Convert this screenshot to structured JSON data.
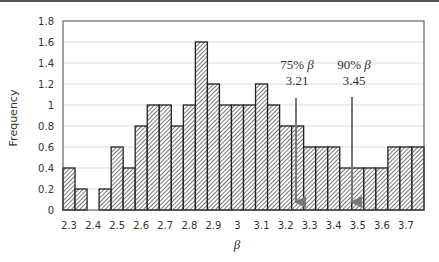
{
  "chart_data": {
    "type": "bar",
    "title": "",
    "xlabel": "β",
    "ylabel": "Frequency",
    "ylim": [
      0,
      1.8
    ],
    "yticks": [
      "0",
      "0.2",
      "0.4",
      "0.6",
      "0.8",
      "1",
      "1.2",
      "1.4",
      "1.6",
      "1.8"
    ],
    "xticks": [
      "2.3",
      "2.4",
      "2.5",
      "2.6",
      "2.7",
      "2.8",
      "2.9",
      "3",
      "3.1",
      "3.2",
      "3.3",
      "3.4",
      "3.5",
      "3.6",
      "3.7"
    ],
    "grid": true,
    "legend": null,
    "bin_width": 0.05,
    "bins_start": [
      2.275,
      2.325,
      2.375,
      2.425,
      2.475,
      2.525,
      2.575,
      2.625,
      2.675,
      2.725,
      2.775,
      2.825,
      2.875,
      2.925,
      2.975,
      3.025,
      3.075,
      3.125,
      3.175,
      3.225,
      3.275,
      3.325,
      3.375,
      3.425,
      3.475,
      3.525,
      3.575,
      3.625,
      3.675,
      3.725
    ],
    "values": [
      0.4,
      0.2,
      0,
      0.2,
      0.6,
      0.4,
      0.8,
      1.0,
      1.0,
      0.8,
      1.0,
      1.6,
      1.2,
      1.0,
      1.0,
      1.0,
      1.2,
      1.0,
      0.8,
      0.8,
      0.6,
      0.6,
      0.6,
      0.4,
      0.4,
      0.4,
      0.4,
      0.6,
      0.6,
      0.6
    ],
    "annotations": [
      {
        "label": "75% β",
        "value": "3.21",
        "x": 3.21,
        "arrow": true
      },
      {
        "label": "90% β",
        "value": "3.45",
        "x": 3.45,
        "arrow": true
      }
    ],
    "bar_style": "diagonal hatch, black outline"
  },
  "labels": {
    "ylabel": "Frequency",
    "xlabel": "β",
    "ann1_label": "75% ",
    "ann1_beta": "β",
    "ann1_value": "3.21",
    "ann2_label": "90% ",
    "ann2_beta": "β",
    "ann2_value": "3.45"
  },
  "colors": {
    "bar_outline": "#222222",
    "hatch": "#555555",
    "grid": "#dddddd",
    "arrow": "#777777",
    "text": "#333333"
  }
}
